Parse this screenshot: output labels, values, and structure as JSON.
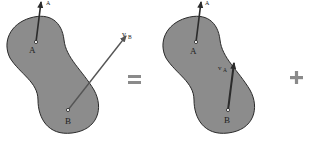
{
  "diagram": {
    "colors": {
      "body_fill": "#8c8c8c",
      "body_stroke": "#2a2a2a",
      "vector": "#2b2b2b",
      "vector_light": "#4a4a4a",
      "operator": "#8a8a8a"
    },
    "panels": [
      {
        "id": "left",
        "points": [
          {
            "label": "A"
          },
          {
            "label": "B"
          }
        ],
        "vectors": [
          {
            "label": "v",
            "subscript": "A",
            "from": "A"
          },
          {
            "label": "v",
            "subscript": "B",
            "from": "B"
          }
        ]
      },
      {
        "id": "middle",
        "points": [
          {
            "label": "A"
          },
          {
            "label": "B"
          }
        ],
        "vectors": [
          {
            "label": "v",
            "subscript": "A",
            "from": "A"
          },
          {
            "label": "v",
            "subscript": "A",
            "from": "B"
          }
        ]
      }
    ],
    "operators": {
      "equals": "=",
      "plus": "+"
    }
  }
}
